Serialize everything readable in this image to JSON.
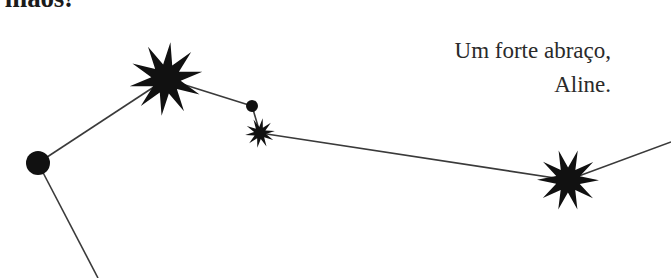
{
  "page": {
    "width": 671,
    "height": 278,
    "background_color": "#ffffff",
    "ink_color": "#1b1b1b"
  },
  "letter": {
    "headline_partial": "s mãos!",
    "closing": "Um forte abraço,",
    "signer": "Aline."
  },
  "artwork": {
    "name": "constellation-illustration",
    "stroke_color": "#3a3a3a",
    "fill_color": "#111111",
    "nodes": [
      {
        "id": "node-left-dot",
        "kind": "dot",
        "cx": 38,
        "cy": 163,
        "r": 12
      },
      {
        "id": "node-big-star",
        "kind": "star-large",
        "cx": 166,
        "cy": 79,
        "r": 37
      },
      {
        "id": "node-mid-dot",
        "kind": "dot",
        "cx": 252,
        "cy": 106,
        "r": 6
      },
      {
        "id": "node-small-star",
        "kind": "star-small",
        "cx": 260,
        "cy": 133,
        "r": 15
      },
      {
        "id": "node-right-star",
        "kind": "star-large",
        "cx": 568,
        "cy": 180,
        "r": 31
      }
    ],
    "edges": [
      {
        "id": "edge-leftdot-bigstar",
        "x1": 38,
        "y1": 163,
        "x2": 166,
        "y2": 79
      },
      {
        "id": "edge-leftdot-bottom",
        "x1": 38,
        "y1": 163,
        "x2": 98,
        "y2": 278
      },
      {
        "id": "edge-bigstar-middot",
        "x1": 166,
        "y1": 79,
        "x2": 252,
        "y2": 106
      },
      {
        "id": "edge-middot-smallstar",
        "x1": 252,
        "y1": 106,
        "x2": 260,
        "y2": 133
      },
      {
        "id": "edge-smallstar-rightstar",
        "x1": 260,
        "y1": 133,
        "x2": 568,
        "y2": 180
      },
      {
        "id": "edge-rightstar-offpage",
        "x1": 568,
        "y1": 180,
        "x2": 671,
        "y2": 142
      }
    ]
  }
}
